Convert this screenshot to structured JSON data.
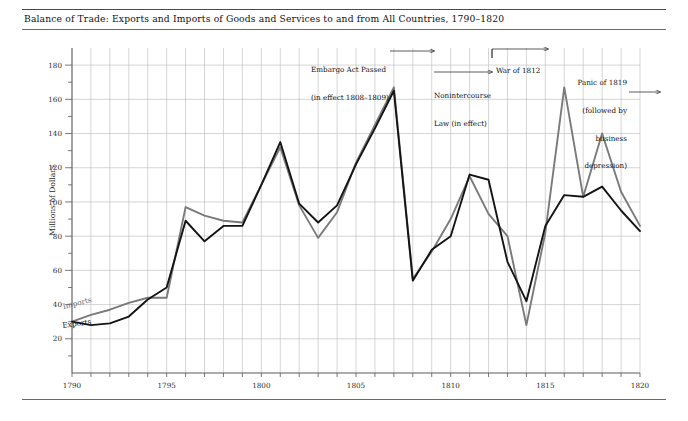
{
  "title": "Balance of Trade: Exports and Imports of Goods and Services  to and from All Countries, 1790–1820",
  "axis": {
    "ylabel": "Millions of Dollars",
    "yticks": [
      20,
      40,
      60,
      80,
      100,
      120,
      140,
      160,
      180
    ],
    "xticks": [
      1790,
      1795,
      1800,
      1805,
      1810,
      1815,
      1820
    ]
  },
  "series_labels": {
    "imports": "Imports",
    "exports": "Exports"
  },
  "annotations": {
    "embargo": {
      "line1": "Embargo Act Passed",
      "line2": "(in effect 1808–1809)"
    },
    "nonintercourse": {
      "line1": "Nonintercourse",
      "line2": "Law (in effect)"
    },
    "war": {
      "line1": "War of 1812"
    },
    "panic": {
      "line1": "Panic of 1819",
      "line2": "(followed by",
      "line3": "business",
      "line4": "depression)"
    }
  },
  "colors": {
    "imports_line": "#7a7a7a",
    "exports_line": "#141414",
    "grid": "#b9b9b9",
    "axis": "#5a5a5a",
    "rule": "#4a4a4a"
  },
  "chart_data": {
    "type": "line",
    "title": "Balance of Trade: Exports and Imports of Goods and Services  to and from All Countries, 1790–1820",
    "xlabel": "",
    "ylabel": "Millions of Dollars",
    "xlim": [
      1790,
      1820
    ],
    "ylim": [
      0,
      190
    ],
    "grid": true,
    "legend": "inline-labels",
    "x": [
      1790,
      1791,
      1792,
      1793,
      1794,
      1795,
      1796,
      1797,
      1798,
      1799,
      1800,
      1801,
      1802,
      1803,
      1804,
      1805,
      1806,
      1807,
      1808,
      1809,
      1810,
      1811,
      1812,
      1813,
      1814,
      1815,
      1816,
      1817,
      1818,
      1819,
      1820
    ],
    "series": [
      {
        "name": "Imports",
        "color": "#7a7a7a",
        "values": [
          30,
          34,
          37,
          41,
          44,
          44,
          97,
          92,
          89,
          88,
          110,
          132,
          98,
          79,
          94,
          123,
          145,
          167,
          55,
          71,
          90,
          115,
          93,
          80,
          28,
          82,
          167,
          103,
          140,
          106,
          86
        ]
      },
      {
        "name": "Exports",
        "color": "#141414",
        "values": [
          30,
          28,
          29,
          33,
          43,
          50,
          89,
          77,
          86,
          86,
          110,
          135,
          99,
          88,
          98,
          122,
          143,
          165,
          54,
          72,
          80,
          116,
          113,
          65,
          42,
          86,
          104,
          103,
          109,
          95,
          83
        ]
      }
    ],
    "annotations": [
      {
        "text": "Embargo Act Passed (in effect 1808–1809)",
        "x_from": 1807,
        "x_to": 1809,
        "y": 180
      },
      {
        "text": "Nonintercourse Law (in effect)",
        "x_from": 1809,
        "x_to": 1811,
        "y": 168
      },
      {
        "text": "War of 1812",
        "x_from": 1812,
        "x_to": 1815,
        "y": 181
      },
      {
        "text": "Panic of 1819 (followed by business depression)",
        "x_from": 1819,
        "x_to": 1820,
        "y": 160
      }
    ]
  }
}
